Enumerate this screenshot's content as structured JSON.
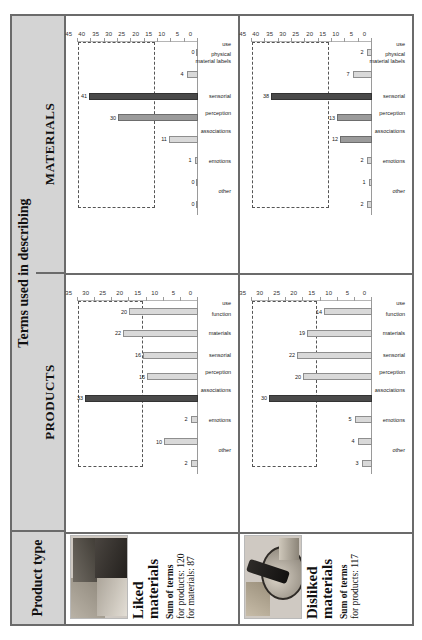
{
  "table": {
    "header": {
      "product_type": "Product type",
      "terms_title": "Terms used in describing",
      "sub_products": "PRODUCTS",
      "sub_materials": "MATERIALS"
    },
    "rows": [
      {
        "title": "Liked materials",
        "thumb_name": "liked-materials-photo",
        "sum_head": "Sum of terms",
        "sum_products": "for products: 120",
        "sum_materials": "for materials: 87"
      },
      {
        "title": "Disliked materials",
        "thumb_name": "disliked-materials-photo",
        "sum_head": "Sum of terms",
        "sum_products": "for products: 117",
        "sum_materials": ""
      }
    ]
  },
  "chart_data": [
    {
      "id": "liked-products",
      "type": "bar",
      "title": "",
      "categories": [
        "other",
        "emotions",
        "associations",
        "perception",
        "sensorial",
        "materials",
        "function",
        "use"
      ],
      "values": [
        2,
        10,
        2,
        33,
        15,
        16,
        22,
        20
      ],
      "highlight_index": 3,
      "xlabel": "",
      "ylabel": "",
      "ylim": [
        0,
        35
      ],
      "yticks": [
        0,
        5,
        10,
        15,
        20,
        25,
        30,
        35
      ],
      "grid": false,
      "legend": "none",
      "annotation_box": {
        "from_value": 16,
        "to_value": 35,
        "style": "dashed"
      }
    },
    {
      "id": "liked-materials",
      "type": "bar",
      "title": "",
      "categories": [
        "other",
        "emotions",
        "associations",
        "perception",
        "sensorial",
        "material labels",
        "physical",
        "use"
      ],
      "values": [
        0,
        0,
        1,
        11,
        30,
        41,
        4,
        0
      ],
      "highlight_index": 5,
      "xlabel": "",
      "ylabel": "",
      "ylim": [
        0,
        45
      ],
      "yticks": [
        0,
        5,
        10,
        15,
        20,
        25,
        30,
        35,
        40,
        45
      ],
      "grid": false,
      "legend": "none",
      "annotation_box": {
        "from_value": 16,
        "to_value": 45,
        "style": "dashed"
      }
    },
    {
      "id": "disliked-products",
      "type": "bar",
      "title": "",
      "categories": [
        "other",
        "emotions",
        "associations",
        "perception",
        "sensorial",
        "materials",
        "function",
        "use"
      ],
      "values": [
        3,
        4,
        5,
        30,
        20,
        22,
        19,
        14
      ],
      "highlight_index": 3,
      "xlabel": "",
      "ylabel": "",
      "ylim": [
        0,
        35
      ],
      "yticks": [
        0,
        5,
        10,
        15,
        20,
        25,
        30,
        35
      ],
      "grid": false,
      "legend": "none",
      "annotation_box": {
        "from_value": 16,
        "to_value": 35,
        "style": "dashed"
      }
    },
    {
      "id": "disliked-materials",
      "type": "bar",
      "title": "",
      "categories": [
        "other",
        "emotions",
        "associations",
        "perception",
        "sensorial",
        "material labels",
        "physical",
        "use"
      ],
      "values": [
        2,
        1,
        2,
        12,
        13,
        38,
        7,
        2
      ],
      "highlight_index": 5,
      "xlabel": "",
      "ylabel": "",
      "ylim": [
        0,
        45
      ],
      "yticks": [
        0,
        5,
        10,
        15,
        20,
        25,
        30,
        35,
        40,
        45
      ],
      "grid": false,
      "legend": "none",
      "annotation_box": {
        "from_value": 16,
        "to_value": 45,
        "style": "dashed"
      }
    }
  ],
  "colors": {
    "header_bg": "#d4d4d4",
    "border": "#6b6b6b",
    "bar_light": "#d9d9d9",
    "bar_mid": "#9b9b9b",
    "bar_dark": "#4a4a4a"
  }
}
